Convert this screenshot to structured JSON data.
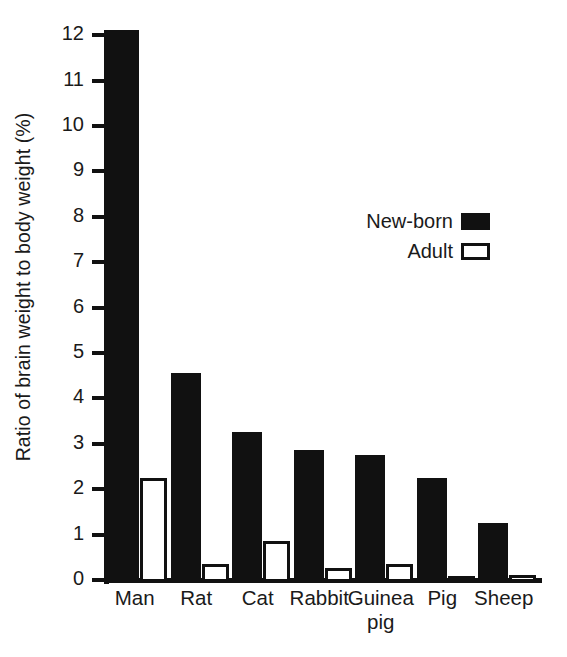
{
  "chart_data": {
    "type": "bar",
    "title": "",
    "subtitle": "",
    "xlabel": "",
    "ylabel": "Ratio of brain weight to body weight (%)",
    "categories": [
      "Man",
      "Rat",
      "Cat",
      "Rabbit",
      "Guinea\npig",
      "Pig",
      "Sheep"
    ],
    "series": [
      {
        "name": "New-born",
        "swatch": "filled",
        "color": "#111111",
        "values": [
          12.15,
          4.6,
          3.3,
          2.9,
          2.8,
          2.3,
          1.3
        ]
      },
      {
        "name": "Adult",
        "swatch": "hollow",
        "color": "#ffffff",
        "values": [
          2.3,
          0.4,
          0.9,
          0.3,
          0.4,
          0.1,
          0.15
        ]
      }
    ],
    "ylim": [
      0,
      12
    ],
    "yticks": [
      0,
      1,
      2,
      3,
      4,
      5,
      6,
      7,
      8,
      9,
      10,
      11,
      12
    ],
    "ytick_labels": [
      "0",
      "1",
      "2",
      "3",
      "4",
      "5",
      "6",
      "7",
      "8",
      "9",
      "10",
      "11",
      "12"
    ],
    "grid": false,
    "legend_position": "upper-right-inside",
    "axis_color": "#111111",
    "background": "#ffffff"
  },
  "legend": {
    "entries": [
      {
        "label": "New-born",
        "style": "filled"
      },
      {
        "label": "Adult",
        "style": "hollow"
      }
    ]
  }
}
